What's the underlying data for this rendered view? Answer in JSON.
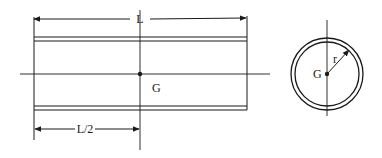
{
  "diagram": {
    "side_view": {
      "length_label": "L",
      "half_length_label": "L/2",
      "center_label": "G"
    },
    "end_view": {
      "center_label": "G",
      "radius_label": "r"
    },
    "colors": {
      "stroke": "#1a1a1a",
      "background": "#ffffff"
    }
  }
}
